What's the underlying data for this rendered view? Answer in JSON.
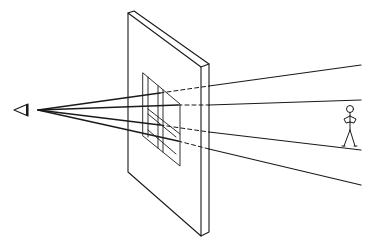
{
  "diagram": {
    "type": "perspective-projection",
    "background": "#ffffff",
    "stroke": "#1a1a1a",
    "elements": {
      "eye": "eye-icon",
      "picture_plane": "picture-plane",
      "projected_image": "projected-figure-on-plane",
      "object": "stick-figure",
      "rays_count": 4
    }
  }
}
